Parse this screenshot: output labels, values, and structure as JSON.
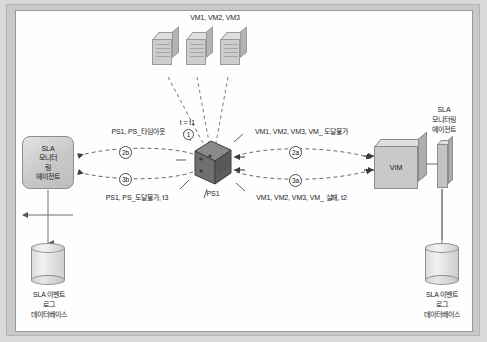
{
  "diagram": {
    "title_present": false,
    "vm_stack_label": "VM1, VM2, VM3",
    "ps1_label": "PS1",
    "time_label": "t = t1",
    "vim_label": "VIM",
    "agents": {
      "left": {
        "line1": "SLA",
        "line2": "모니터",
        "line3": "링",
        "line4": "에이전트"
      },
      "right": {
        "line1": "SLA",
        "line2": "모니터링",
        "line3": "에이전트"
      }
    },
    "databases": {
      "left": {
        "line1": "SLA 이벤트",
        "line2": "로그",
        "line3": "데이터베이스"
      },
      "right": {
        "line1": "SLA 이벤트",
        "line2": "로그",
        "line3": "데이터베이스"
      }
    },
    "messages": {
      "left_top": "PS1, PS_타임아웃",
      "left_bottom": "PS1, PS_도달불가, t3",
      "right_top": "VM1, VM2, VM3, VM_ 도달불가",
      "right_bottom": "VM1, VM2, VM3, VM_ 실패, t2"
    },
    "steps": {
      "one": "1",
      "two_b": "2b",
      "three_b": "3b",
      "two_a": "2a",
      "three_a": "3a"
    },
    "colors": {
      "page_background": "#d9d9d9",
      "frame": "#c9c9c9",
      "panel": "#fefefe",
      "node_fill": "#c6c6c6",
      "node_stroke": "#8d8d8d",
      "ps1_fill": "#6f6f6f",
      "line": "#6a6a6a",
      "text": "#1b1b1b"
    }
  }
}
